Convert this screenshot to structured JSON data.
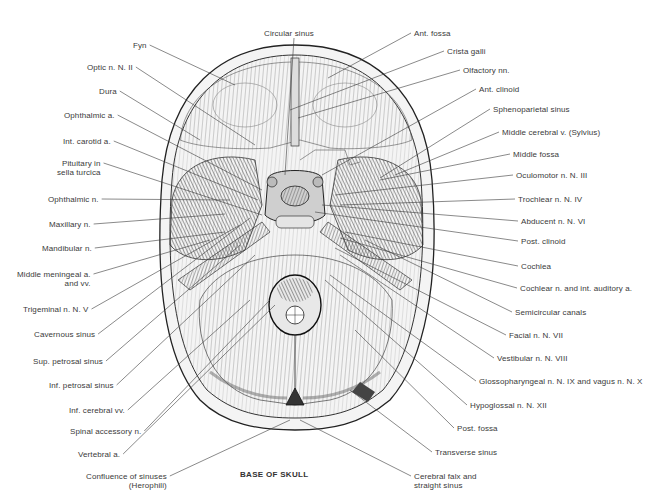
{
  "figure": {
    "title": "BASE OF SKULL",
    "colors": {
      "ink": "#2a2a2a",
      "label": "#3a3a3a",
      "background": "#ffffff",
      "bone": "#f2f2f2"
    }
  },
  "labels_left": [
    {
      "text": "Fyn",
      "x": 133,
      "y": 41,
      "tx": 235,
      "ty": 85
    },
    {
      "text": "Optic n. N. II",
      "x": 87,
      "y": 63,
      "tx": 255,
      "ty": 145
    },
    {
      "text": "Dura",
      "x": 99,
      "y": 87,
      "tx": 200,
      "ty": 140
    },
    {
      "text": "Ophthalmic a.",
      "x": 64,
      "y": 111,
      "tx": 262,
      "ty": 190
    },
    {
      "text": "Int. carotid a.",
      "x": 63,
      "y": 137,
      "tx": 258,
      "ty": 200
    },
    {
      "text": "Pituitary in\nsella turcica",
      "x": 57,
      "y": 159,
      "tx": 262,
      "ty": 215
    },
    {
      "text": "Ophthalmic n.",
      "x": 48,
      "y": 195,
      "tx": 230,
      "ty": 200
    },
    {
      "text": "Maxillary n.",
      "x": 49,
      "y": 220,
      "tx": 225,
      "ty": 214
    },
    {
      "text": "Mandibular n.",
      "x": 42,
      "y": 244,
      "tx": 225,
      "ty": 232
    },
    {
      "text": "Middle meningeal a.\nand vv.",
      "x": 17,
      "y": 270,
      "tx": 210,
      "ty": 240
    },
    {
      "text": "Trigeminal n. N. V",
      "x": 23,
      "y": 305,
      "tx": 240,
      "ty": 225
    },
    {
      "text": "Cavernous sinus",
      "x": 34,
      "y": 330,
      "tx": 250,
      "ty": 218
    },
    {
      "text": "Sup. petrosal sinus",
      "x": 33,
      "y": 357,
      "tx": 240,
      "ty": 245
    },
    {
      "text": "Inf. petrosal sinus",
      "x": 49,
      "y": 381,
      "tx": 255,
      "ty": 255
    },
    {
      "text": "Inf. cerebral vv.",
      "x": 69,
      "y": 406,
      "tx": 250,
      "ty": 300
    },
    {
      "text": "Spinal accessory n.",
      "x": 70,
      "y": 427,
      "tx": 270,
      "ty": 300
    },
    {
      "text": "Vertebral a.",
      "x": 78,
      "y": 450,
      "tx": 275,
      "ty": 305
    },
    {
      "text": "Confluence of sinuses\n(Herophili)",
      "x": 86,
      "y": 472,
      "tx": 290,
      "ty": 420
    }
  ],
  "labels_right": [
    {
      "text": "Circular sinus",
      "x": 264,
      "y": 29,
      "tx": 285,
      "ty": 175,
      "center": true
    },
    {
      "text": "Ant. fossa",
      "x": 414,
      "y": 29,
      "tx": 328,
      "ty": 78
    },
    {
      "text": "Crista galli",
      "x": 447,
      "y": 47,
      "tx": 290,
      "ty": 110
    },
    {
      "text": "Olfactory nn.",
      "x": 463,
      "y": 66,
      "tx": 298,
      "ty": 118
    },
    {
      "text": "Ant. clinoid",
      "x": 479,
      "y": 85,
      "tx": 322,
      "ty": 175
    },
    {
      "text": "Sphenoparietal sinus",
      "x": 493,
      "y": 105,
      "tx": 380,
      "ty": 178
    },
    {
      "text": "Middle cerebral v. (Sylvius)",
      "x": 502,
      "y": 128,
      "tx": 395,
      "ty": 175
    },
    {
      "text": "Middle fossa",
      "x": 513,
      "y": 150,
      "tx": 380,
      "ty": 180
    },
    {
      "text": "Oculomotor n. N. III",
      "x": 516,
      "y": 171,
      "tx": 335,
      "ty": 195
    },
    {
      "text": "Trochlear n. N. IV",
      "x": 518,
      "y": 195,
      "tx": 340,
      "ty": 205
    },
    {
      "text": "Abducent n. N. VI",
      "x": 521,
      "y": 217,
      "tx": 322,
      "ty": 205
    },
    {
      "text": "Post. clinoid",
      "x": 521,
      "y": 237,
      "tx": 315,
      "ty": 212
    },
    {
      "text": "Cochlea",
      "x": 521,
      "y": 262,
      "tx": 345,
      "ty": 232
    },
    {
      "text": "Cochlear n. and int. auditory a.",
      "x": 520,
      "y": 284,
      "tx": 340,
      "ty": 238
    },
    {
      "text": "Semicircular canals",
      "x": 515,
      "y": 308,
      "tx": 365,
      "ty": 240
    },
    {
      "text": "Facial n. N. VII",
      "x": 509,
      "y": 331,
      "tx": 335,
      "ty": 248
    },
    {
      "text": "Vestibular n. N. VIII",
      "x": 497,
      "y": 354,
      "tx": 340,
      "ty": 255
    },
    {
      "text": "Glossopharyngeal n. N. IX and vagus n. N. X",
      "x": 479,
      "y": 377,
      "tx": 330,
      "ty": 275
    },
    {
      "text": "Hypoglossal n. N. XII",
      "x": 470,
      "y": 401,
      "tx": 325,
      "ty": 280
    },
    {
      "text": "Post. fossa",
      "x": 457,
      "y": 424,
      "tx": 355,
      "ty": 330
    },
    {
      "text": "Transverse sinus",
      "x": 435,
      "y": 448,
      "tx": 350,
      "ty": 390
    },
    {
      "text": "Cerebral falx and\nstraight sinus",
      "x": 414,
      "y": 472,
      "tx": 300,
      "ty": 420
    }
  ]
}
